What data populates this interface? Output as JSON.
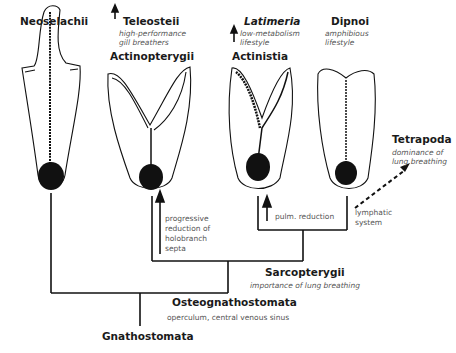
{
  "taxa": {
    "neoselachii": {
      "name": "Neoselachii"
    },
    "teleostei": {
      "name": "Teleosteii",
      "note1": "high-performance",
      "note2": "gill breathers"
    },
    "actinopterygii": {
      "name": "Actinopterygii"
    },
    "latimeria": {
      "name": "Latimeria",
      "note1": "low-metabolism",
      "note2": "lifestyle"
    },
    "actinistia": {
      "name": "Actinistia"
    },
    "dipnoi": {
      "name": "Dipnoi",
      "note1": "amphibious",
      "note2": "lifestyle"
    },
    "tetrapoda": {
      "name": "Tetrapoda",
      "note1": "dominance of",
      "note2": "lung breathing"
    }
  },
  "nodes": {
    "sarcopterygii": {
      "name": "Sarcopterygii",
      "note": "importance of lung breathing"
    },
    "osteognathostomata": {
      "name": "Osteognathostomata",
      "note": "operculum, central venous sinus"
    },
    "gnathostomata": {
      "name": "Gnathostomata"
    }
  },
  "annotations": {
    "holobranch": [
      "progressive",
      "reduction of",
      "holobranch",
      "septa"
    ],
    "pulm": "pulm. reduction",
    "lymph": [
      "lymphatic",
      "system"
    ]
  }
}
